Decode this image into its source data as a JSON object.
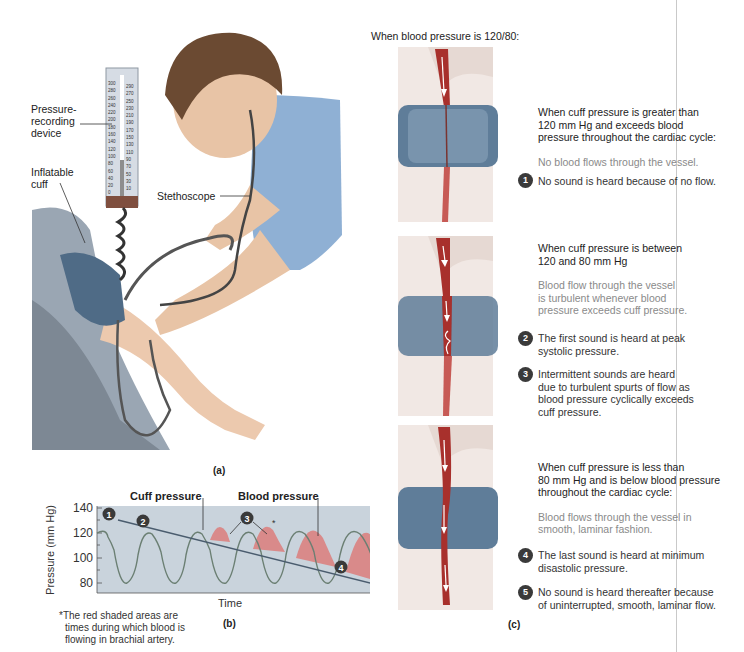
{
  "panel_a": {
    "caption": "(a)",
    "labels": {
      "pressure_device": [
        "Pressure-",
        "recording",
        "device"
      ],
      "cuff": [
        "Inflatable",
        "cuff"
      ],
      "stethoscope": "Stethoscope"
    },
    "manometer_scale_left": [
      "300",
      "280",
      "260",
      "240",
      "220",
      "200",
      "180",
      "160",
      "140",
      "120",
      "100",
      "80",
      "60",
      "40",
      "20",
      "0"
    ],
    "manometer_scale_right": [
      "290",
      "270",
      "250",
      "230",
      "210",
      "190",
      "170",
      "150",
      "130",
      "110",
      "90",
      "70",
      "50",
      "30",
      "10"
    ]
  },
  "panel_b": {
    "caption": "(b)",
    "footnote": [
      "*The red shaded areas are",
      "times during which blood is",
      "flowing in brachial artery."
    ]
  },
  "panel_c": {
    "caption": "(c)",
    "intro": "When blood pressure is 120/80:",
    "sections": [
      {
        "heading": [
          "When cuff pressure is greater than",
          "120 mm Hg and exceeds blood",
          "pressure throughout the cardiac cycle:"
        ],
        "description": [
          "No blood flows through the vessel."
        ],
        "items": [
          {
            "num": "1",
            "text": [
              "No sound is heard because of no flow."
            ]
          }
        ]
      },
      {
        "heading": [
          "When cuff pressure is between",
          "120 and 80 mm Hg"
        ],
        "description": [
          "Blood flow through the vessel",
          "is turbulent whenever blood",
          "pressure exceeds cuff pressure."
        ],
        "items": [
          {
            "num": "2",
            "text": [
              "The first sound is heard at peak",
              "systolic pressure."
            ]
          },
          {
            "num": "3",
            "text": [
              "Intermittent sounds are heard",
              "due to turbulent spurts of flow as",
              "blood pressure cyclically exceeds",
              "cuff pressure."
            ]
          }
        ]
      },
      {
        "heading": [
          "When cuff pressure is less than",
          "80 mm Hg and is below blood pressure",
          "throughout the cardiac cycle:"
        ],
        "description": [
          "Blood flows through the vessel in",
          "smooth, laminar fashion."
        ],
        "items": [
          {
            "num": "4",
            "text": [
              "The last sound is heard at minimum",
              "disastolic pressure."
            ]
          },
          {
            "num": "5",
            "text": [
              "No sound is heard thereafter because",
              "of uninterrupted, smooth, laminar flow."
            ]
          }
        ]
      }
    ]
  },
  "colors": {
    "plot_bg": "#c9d3dc",
    "blood_shade": "#d98a8a",
    "vessel_red": "#a8302c",
    "cuff_blue": "#4f6b86",
    "shirt_blue": "#7f9ec0",
    "skin": "#e9c7ad",
    "badge": "#3a3a3a"
  },
  "chart_data": {
    "type": "line",
    "title": "",
    "xlabel": "Time",
    "ylabel": "Pressure (mm Hg)",
    "ylim": [
      70,
      140
    ],
    "yticks": [
      80,
      100,
      120,
      140
    ],
    "series": [
      {
        "name": "Cuff pressure",
        "description": "linear decline",
        "x": [
          0,
          1
        ],
        "values": [
          126,
          74
        ]
      },
      {
        "name": "Blood pressure",
        "description": "oscillating waveform, 6 cycles",
        "peaks": [
          120,
          120,
          120,
          120,
          120,
          120
        ],
        "troughs": [
          82,
          82,
          82,
          82,
          82
        ]
      }
    ],
    "annotations": [
      {
        "label": "Cuff pressure",
        "type": "callout"
      },
      {
        "label": "Blood pressure",
        "type": "callout"
      },
      {
        "label": "1",
        "note": "cuff above systolic"
      },
      {
        "label": "2",
        "note": "first sound at peak systolic"
      },
      {
        "label": "3",
        "note": "intermittent sounds"
      },
      {
        "label": "4",
        "note": "last sound at diastolic"
      },
      {
        "label": "5",
        "note": "no sound thereafter"
      },
      {
        "label": "*",
        "note": "red shaded areas = blood flowing"
      }
    ],
    "grid": false,
    "legend": "none"
  }
}
